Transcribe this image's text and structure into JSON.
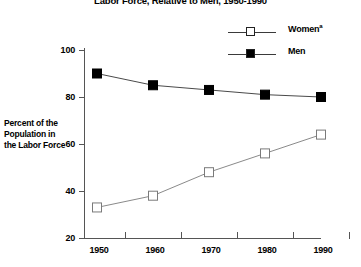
{
  "chart_data": {
    "type": "line",
    "title": "Labor Force, Relative to Men, 1950-1990",
    "xlabel": "",
    "ylabel": "Percent of the Population in the Labor Force",
    "ylabel_lines": [
      "Percent of the",
      "Population in",
      "the Labor Force"
    ],
    "categories": [
      "1950",
      "1960",
      "1970",
      "1980",
      "1990"
    ],
    "x": [
      1950,
      1960,
      1970,
      1980,
      1990
    ],
    "series": [
      {
        "name": "Women",
        "name_superscript": "a",
        "marker": "open-square",
        "color": "#6b6b6b",
        "values": [
          33,
          38,
          48,
          56,
          64
        ]
      },
      {
        "name": "Men",
        "name_superscript": "",
        "marker": "filled-square",
        "color": "#000000",
        "values": [
          90,
          85,
          83,
          81,
          80
        ]
      }
    ],
    "ylim": [
      20,
      100
    ],
    "yticks": [
      20,
      40,
      60,
      80,
      100
    ],
    "ytick_labels": [
      "20",
      "40",
      "60",
      "80",
      "100"
    ],
    "xtick_labels": [
      "1950",
      "1960",
      "1970",
      "1980",
      "1990"
    ],
    "grid": false,
    "legend_position": "top-right"
  },
  "legend": {
    "entries": [
      {
        "label": "Women",
        "sup": "a"
      },
      {
        "label": "Men",
        "sup": ""
      }
    ]
  },
  "axes": {
    "y": {
      "t100": "100",
      "t80": "80",
      "t60": "60",
      "t40": "40",
      "t20": "20"
    },
    "x": {
      "t1950": "1950",
      "t1960": "1960",
      "t1970": "1970",
      "t1980": "1980",
      "t1990": "1990"
    }
  },
  "labels": {
    "y_line1": "Percent of the",
    "y_line2": "Population in",
    "y_line3": "the Labor Force",
    "title": "Labor Force, Relative to Men, 1950-1990"
  }
}
